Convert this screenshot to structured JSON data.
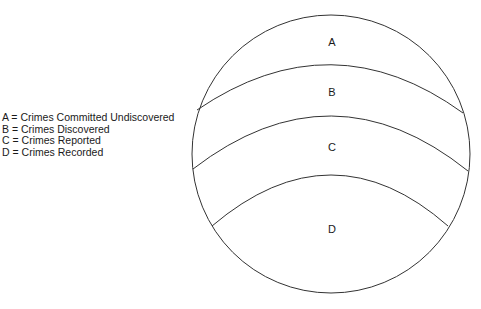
{
  "legend": {
    "items": [
      {
        "key": "A",
        "text": "A = Crimes Committed Undiscovered"
      },
      {
        "key": "B",
        "text": "B = Crimes Discovered"
      },
      {
        "key": "C",
        "text": "C = Crimes Reported"
      },
      {
        "key": "D",
        "text": "D = Crimes Recorded"
      }
    ]
  },
  "diagram": {
    "regions": [
      {
        "label": "A"
      },
      {
        "label": "B"
      },
      {
        "label": "C"
      },
      {
        "label": "D"
      }
    ],
    "stroke_color": "#333333"
  }
}
